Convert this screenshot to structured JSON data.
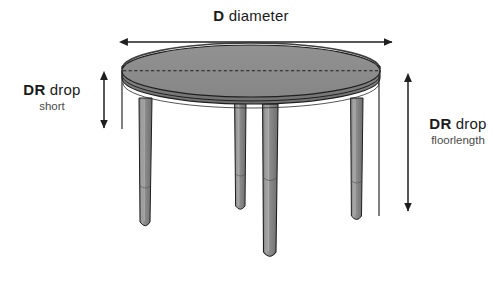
{
  "figure": {
    "kind": "round-table-dimension-diagram",
    "background_color": "#ffffff",
    "line_color": "#1a1a1a"
  },
  "labels": {
    "diameter": {
      "code": "D",
      "text": "diameter",
      "subtext": ""
    },
    "drop_short": {
      "code": "DR",
      "text": "drop",
      "subtext": "short"
    },
    "drop_floorlength": {
      "code": "DR",
      "text": "drop",
      "subtext": "floorlength"
    }
  },
  "dimension_lines": {
    "diameter": {
      "orientation": "horizontal",
      "x1": 121,
      "x2": 392,
      "y": 42,
      "arrows": "both"
    },
    "drop_short": {
      "orientation": "vertical",
      "x": 104,
      "y1": 73,
      "y2": 128,
      "arrows": "both"
    },
    "drop_floorlength": {
      "orientation": "vertical",
      "x": 408,
      "y1": 75,
      "y2": 211,
      "arrows": "both"
    }
  },
  "table": {
    "top_ellipse": {
      "cx": 251,
      "cy": 71,
      "rx": 129,
      "ry": 26
    },
    "apron_depth": 22,
    "legs": [
      {
        "name": "leg-back-left",
        "x_top": 141,
        "x_bottom": 137,
        "y_top": 100,
        "y_bottom": 228,
        "width_top": 11,
        "width_bottom": 13
      },
      {
        "name": "leg-back-right",
        "x_top": 236,
        "x_bottom": 234,
        "y_top": 104,
        "y_bottom": 212,
        "width_top": 10,
        "width_bottom": 12
      },
      {
        "name": "leg-front-center",
        "x_top": 265,
        "x_bottom": 262,
        "y_top": 106,
        "y_bottom": 259,
        "width_top": 13,
        "width_bottom": 15
      },
      {
        "name": "leg-front-right",
        "x_top": 352,
        "x_bottom": 350,
        "y_top": 100,
        "y_bottom": 222,
        "width_top": 11,
        "width_bottom": 13
      }
    ],
    "drop_indicator_short": {
      "x": 122,
      "y1": 72,
      "y2": 129
    },
    "drop_indicator_floorlength": {
      "x": 379,
      "y1": 74,
      "y2": 216
    }
  },
  "colors": {
    "top_surface": "#8c8c8c",
    "top_surface_light": "#9a9a9a",
    "apron": "#7d7d7d",
    "apron_shadow": "#6f6f6f",
    "leg_fill": "#8a8a8a",
    "leg_highlight": "#a6a6a6",
    "leg_shade": "#6e6e6e",
    "outline": "#1f1f1f",
    "label_primary": "#1a1a1a",
    "label_secondary": "#4a4a4a"
  }
}
